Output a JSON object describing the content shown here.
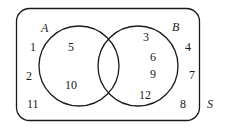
{
  "diagram": {
    "type": "venn",
    "universe_label": "S",
    "sets": [
      {
        "name": "A",
        "elements_only": [
          "5",
          "10"
        ]
      },
      {
        "name": "B",
        "elements_only": [
          "3",
          "6",
          "9",
          "12"
        ]
      }
    ],
    "intersection": [],
    "outside": [
      "1",
      "2",
      "11",
      "4",
      "7",
      "8"
    ],
    "labels": {
      "a": "A",
      "b": "B",
      "s": "S"
    },
    "numbers": {
      "n1": "1",
      "n2": "2",
      "n11": "11",
      "n5": "5",
      "n10": "10",
      "n3": "3",
      "n6": "6",
      "n9": "9",
      "n12": "12",
      "n4": "4",
      "n7": "7",
      "n8": "8"
    },
    "stroke_color": "#1a1a1a"
  }
}
